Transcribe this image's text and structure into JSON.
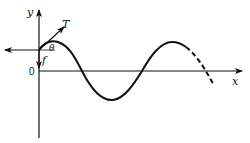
{
  "diagram": {
    "type": "string-wave-force-diagram",
    "labels": {
      "y_axis": "y",
      "x_axis": "x",
      "origin": "0",
      "tension": "T",
      "angle": "θ",
      "force": "f"
    },
    "colors": {
      "stroke": "#111111",
      "background": "#ffffff"
    },
    "curve": {
      "solid_segment": "sinusoidal wave from string end through one full period",
      "dashed_segment": "continuation beyond second crest"
    }
  }
}
